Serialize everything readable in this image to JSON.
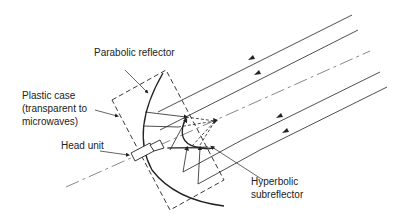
{
  "diagram": {
    "labels": {
      "parabolic_reflector": "Parabolic reflector",
      "plastic_case_line1": "Plastic case",
      "plastic_case_line2": "(transparent to",
      "plastic_case_line3": "microwaves)",
      "head_unit": "Head unit",
      "hyperbolic_line1": "Hyperbolic",
      "hyperbolic_line2": "subreflector"
    },
    "colors": {
      "line": "#222222",
      "text": "#222222",
      "background": "#ffffff"
    }
  }
}
